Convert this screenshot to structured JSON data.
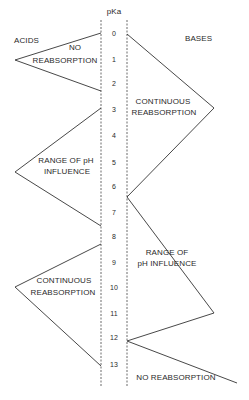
{
  "axis": {
    "title": "pKa",
    "ticks": [
      "0",
      "1",
      "2",
      "3",
      "4",
      "5",
      "6",
      "7",
      "8",
      "9",
      "10",
      "11",
      "12",
      "13"
    ]
  },
  "headers": {
    "acids": "ACIDS",
    "bases": "BASES"
  },
  "acids_regions": [
    {
      "line1": "NO",
      "line2": "REABSORPTION",
      "pka_range": [
        0,
        2
      ]
    },
    {
      "line1": "RANGE OF pH",
      "line2": "INFLUENCE",
      "pka_range": [
        3,
        7.5
      ]
    },
    {
      "line1": "CONTINUOUS",
      "line2": "REABSORPTION",
      "pka_range": [
        8.2,
        13
      ]
    }
  ],
  "bases_regions": [
    {
      "line1": "CONTINUOUS",
      "line2": "REABSORPTION",
      "pka_range": [
        0,
        6
      ]
    },
    {
      "line1": "RANGE OF",
      "line2": "pH INFLUENCE",
      "pka_range": [
        6,
        12
      ]
    },
    {
      "line1": "NO REABSORPTION",
      "line2": "",
      "pka_range": [
        12,
        14
      ]
    }
  ],
  "colors": {
    "line": "#333333",
    "text": "#2a2a2a"
  }
}
